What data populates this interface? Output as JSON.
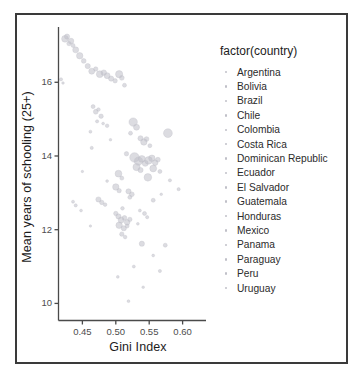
{
  "chart_data": {
    "type": "scatter",
    "title": "",
    "xlabel": "Gini Index",
    "ylabel": "Mean years of schooling (25+)",
    "xlim": [
      0.415,
      0.635
    ],
    "ylim": [
      9.55,
      17.5
    ],
    "xticks": [
      0.45,
      0.5,
      0.55,
      0.6
    ],
    "xtick_labels": [
      "0.45",
      "0.50",
      "0.55",
      "0.60"
    ],
    "yticks": [
      10,
      12,
      14,
      16
    ],
    "ytick_labels": [
      "10",
      "12",
      "14",
      "16"
    ],
    "grid": false,
    "legend": {
      "position": "right",
      "title": "factor(country)",
      "entries": [
        "Argentina",
        "Bolivia",
        "Brazil",
        "Chile",
        "Colombia",
        "Costa Rica",
        "Dominican Republic",
        "Ecuador",
        "El Salvador",
        "Guatemala",
        "Honduras",
        "Mexico",
        "Panama",
        "Paraguay",
        "Peru",
        "Uruguay"
      ]
    },
    "point_color": "#c0c0c8",
    "point_opacity": 0.55,
    "points": [
      {
        "x": 0.424,
        "y": 17.18,
        "r": 3.4
      },
      {
        "x": 0.427,
        "y": 17.24,
        "r": 2.6
      },
      {
        "x": 0.43,
        "y": 17.05,
        "r": 2.2
      },
      {
        "x": 0.433,
        "y": 17.12,
        "r": 2.8
      },
      {
        "x": 0.436,
        "y": 17.0,
        "r": 2.0
      },
      {
        "x": 0.44,
        "y": 16.88,
        "r": 3.0
      },
      {
        "x": 0.446,
        "y": 16.72,
        "r": 3.2
      },
      {
        "x": 0.452,
        "y": 16.58,
        "r": 2.4
      },
      {
        "x": 0.458,
        "y": 16.44,
        "r": 2.6
      },
      {
        "x": 0.464,
        "y": 16.3,
        "r": 3.0
      },
      {
        "x": 0.47,
        "y": 16.36,
        "r": 2.2
      },
      {
        "x": 0.476,
        "y": 16.22,
        "r": 3.4
      },
      {
        "x": 0.482,
        "y": 16.26,
        "r": 2.8
      },
      {
        "x": 0.487,
        "y": 16.18,
        "r": 3.0
      },
      {
        "x": 0.493,
        "y": 16.1,
        "r": 2.6
      },
      {
        "x": 0.499,
        "y": 16.04,
        "r": 2.2
      },
      {
        "x": 0.505,
        "y": 16.22,
        "r": 3.6
      },
      {
        "x": 0.509,
        "y": 16.12,
        "r": 2.4
      },
      {
        "x": 0.513,
        "y": 15.92,
        "r": 2.0
      },
      {
        "x": 0.418,
        "y": 16.08,
        "r": 1.6
      },
      {
        "x": 0.421,
        "y": 15.98,
        "r": 1.3
      },
      {
        "x": 0.466,
        "y": 15.34,
        "r": 2.0
      },
      {
        "x": 0.47,
        "y": 15.2,
        "r": 2.4
      },
      {
        "x": 0.474,
        "y": 15.26,
        "r": 1.8
      },
      {
        "x": 0.478,
        "y": 15.08,
        "r": 2.2
      },
      {
        "x": 0.472,
        "y": 14.94,
        "r": 1.6
      },
      {
        "x": 0.481,
        "y": 14.88,
        "r": 1.4
      },
      {
        "x": 0.487,
        "y": 14.82,
        "r": 1.8
      },
      {
        "x": 0.462,
        "y": 14.66,
        "r": 1.5
      },
      {
        "x": 0.526,
        "y": 14.92,
        "r": 4.2
      },
      {
        "x": 0.531,
        "y": 14.78,
        "r": 3.0
      },
      {
        "x": 0.522,
        "y": 14.62,
        "r": 2.0
      },
      {
        "x": 0.537,
        "y": 14.48,
        "r": 2.6
      },
      {
        "x": 0.542,
        "y": 14.38,
        "r": 3.2
      },
      {
        "x": 0.546,
        "y": 14.46,
        "r": 2.4
      },
      {
        "x": 0.551,
        "y": 14.28,
        "r": 2.0
      },
      {
        "x": 0.578,
        "y": 14.62,
        "r": 4.4
      },
      {
        "x": 0.464,
        "y": 14.22,
        "r": 1.6
      },
      {
        "x": 0.516,
        "y": 14.06,
        "r": 2.2
      },
      {
        "x": 0.528,
        "y": 13.96,
        "r": 4.8
      },
      {
        "x": 0.534,
        "y": 13.86,
        "r": 4.2
      },
      {
        "x": 0.539,
        "y": 13.92,
        "r": 3.4
      },
      {
        "x": 0.544,
        "y": 13.8,
        "r": 3.0
      },
      {
        "x": 0.549,
        "y": 13.88,
        "r": 3.8
      },
      {
        "x": 0.554,
        "y": 13.94,
        "r": 3.2
      },
      {
        "x": 0.559,
        "y": 13.82,
        "r": 2.8
      },
      {
        "x": 0.563,
        "y": 13.9,
        "r": 2.4
      },
      {
        "x": 0.531,
        "y": 13.7,
        "r": 3.6
      },
      {
        "x": 0.537,
        "y": 13.62,
        "r": 2.6
      },
      {
        "x": 0.556,
        "y": 13.66,
        "r": 3.4
      },
      {
        "x": 0.566,
        "y": 13.58,
        "r": 2.0
      },
      {
        "x": 0.504,
        "y": 13.52,
        "r": 3.4
      },
      {
        "x": 0.509,
        "y": 13.4,
        "r": 2.0
      },
      {
        "x": 0.548,
        "y": 13.42,
        "r": 3.8
      },
      {
        "x": 0.581,
        "y": 13.34,
        "r": 1.6
      },
      {
        "x": 0.5,
        "y": 13.16,
        "r": 3.2
      },
      {
        "x": 0.505,
        "y": 13.06,
        "r": 2.2
      },
      {
        "x": 0.519,
        "y": 13.04,
        "r": 2.6
      },
      {
        "x": 0.524,
        "y": 12.96,
        "r": 2.4
      },
      {
        "x": 0.521,
        "y": 12.88,
        "r": 2.0
      },
      {
        "x": 0.594,
        "y": 13.1,
        "r": 1.6
      },
      {
        "x": 0.436,
        "y": 12.76,
        "r": 1.5
      },
      {
        "x": 0.44,
        "y": 12.66,
        "r": 1.6
      },
      {
        "x": 0.474,
        "y": 12.82,
        "r": 2.6
      },
      {
        "x": 0.479,
        "y": 12.74,
        "r": 2.2
      },
      {
        "x": 0.484,
        "y": 12.68,
        "r": 1.8
      },
      {
        "x": 0.556,
        "y": 12.8,
        "r": 2.0
      },
      {
        "x": 0.448,
        "y": 12.52,
        "r": 1.4
      },
      {
        "x": 0.51,
        "y": 12.58,
        "r": 1.8
      },
      {
        "x": 0.536,
        "y": 12.52,
        "r": 1.5
      },
      {
        "x": 0.5,
        "y": 12.44,
        "r": 2.2
      },
      {
        "x": 0.504,
        "y": 12.36,
        "r": 2.6
      },
      {
        "x": 0.508,
        "y": 12.26,
        "r": 3.0
      },
      {
        "x": 0.513,
        "y": 12.32,
        "r": 2.4
      },
      {
        "x": 0.517,
        "y": 12.2,
        "r": 2.8
      },
      {
        "x": 0.521,
        "y": 12.28,
        "r": 2.2
      },
      {
        "x": 0.505,
        "y": 12.12,
        "r": 3.2
      },
      {
        "x": 0.512,
        "y": 12.04,
        "r": 2.6
      },
      {
        "x": 0.517,
        "y": 12.1,
        "r": 2.0
      },
      {
        "x": 0.543,
        "y": 12.44,
        "r": 2.0
      },
      {
        "x": 0.547,
        "y": 12.34,
        "r": 1.6
      },
      {
        "x": 0.533,
        "y": 12.16,
        "r": 1.4
      },
      {
        "x": 0.509,
        "y": 11.88,
        "r": 2.2
      },
      {
        "x": 0.514,
        "y": 11.8,
        "r": 1.8
      },
      {
        "x": 0.539,
        "y": 11.62,
        "r": 2.6
      },
      {
        "x": 0.574,
        "y": 11.58,
        "r": 2.0
      },
      {
        "x": 0.556,
        "y": 11.3,
        "r": 1.4
      },
      {
        "x": 0.527,
        "y": 11.0,
        "r": 1.5
      },
      {
        "x": 0.566,
        "y": 10.88,
        "r": 1.6
      },
      {
        "x": 0.503,
        "y": 10.72,
        "r": 1.4
      },
      {
        "x": 0.541,
        "y": 10.44,
        "r": 1.3
      },
      {
        "x": 0.519,
        "y": 10.06,
        "r": 1.4
      },
      {
        "x": 0.45,
        "y": 13.58,
        "r": 1.2
      },
      {
        "x": 0.492,
        "y": 14.44,
        "r": 1.3
      },
      {
        "x": 0.487,
        "y": 13.32,
        "r": 1.4
      },
      {
        "x": 0.568,
        "y": 12.96,
        "r": 1.3
      },
      {
        "x": 0.462,
        "y": 12.1,
        "r": 1.2
      }
    ]
  }
}
